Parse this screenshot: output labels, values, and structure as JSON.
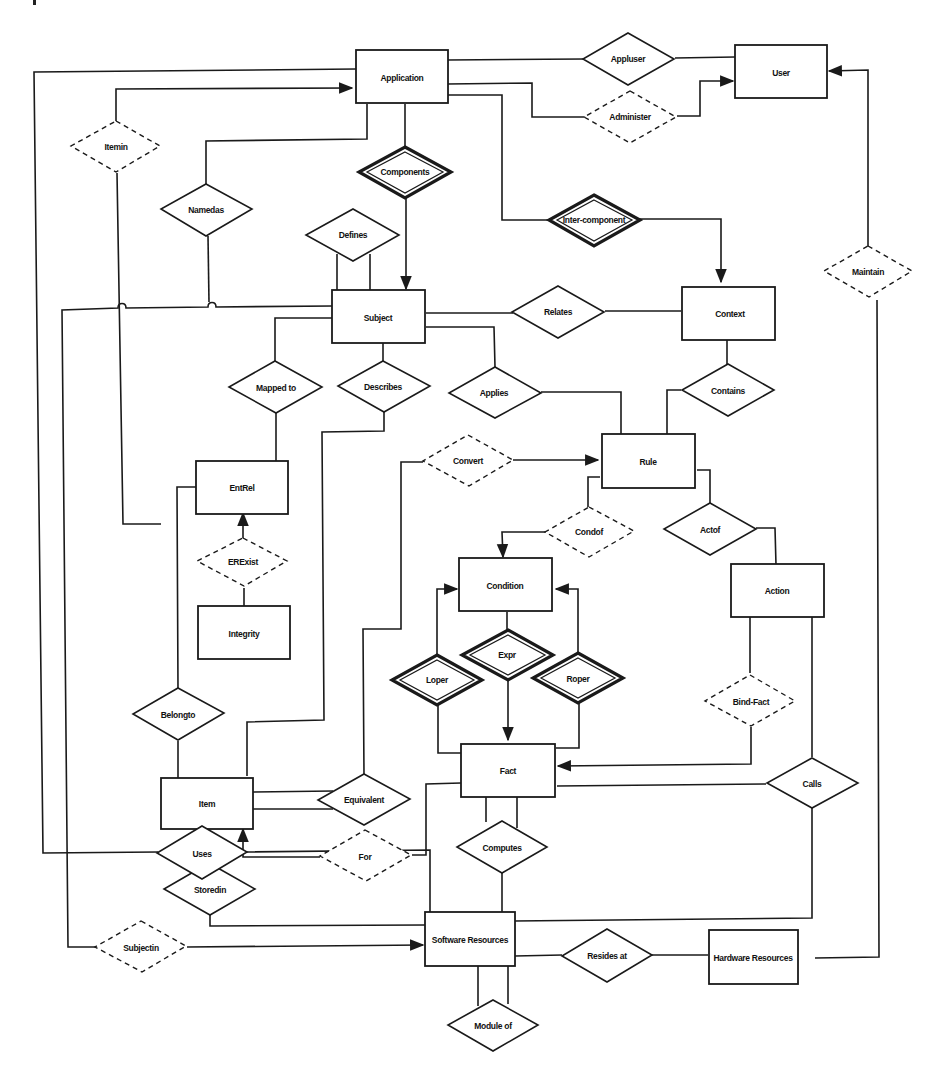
{
  "diagram": {
    "type": "entity-relationship",
    "entities": [
      {
        "id": "application",
        "label": "Application"
      },
      {
        "id": "user",
        "label": "User"
      },
      {
        "id": "subject",
        "label": "Subject"
      },
      {
        "id": "context",
        "label": "Context"
      },
      {
        "id": "entrel",
        "label": "EntRel"
      },
      {
        "id": "rule",
        "label": "Rule"
      },
      {
        "id": "integrity",
        "label": "Integrity"
      },
      {
        "id": "condition",
        "label": "Condition"
      },
      {
        "id": "action",
        "label": "Action"
      },
      {
        "id": "fact",
        "label": "Fact"
      },
      {
        "id": "item",
        "label": "Item"
      },
      {
        "id": "software_resources",
        "label": "Software Resources"
      },
      {
        "id": "hardware_resources",
        "label": "Hardware Resources"
      }
    ],
    "relationships": [
      {
        "id": "appluser",
        "label": "Appluser",
        "style": "solid"
      },
      {
        "id": "administer",
        "label": "Administer",
        "style": "dashed"
      },
      {
        "id": "itemin",
        "label": "Itemin",
        "style": "dashed"
      },
      {
        "id": "components",
        "label": "Components",
        "style": "identifying"
      },
      {
        "id": "namedas",
        "label": "Namedas",
        "style": "solid"
      },
      {
        "id": "defines",
        "label": "Defines",
        "style": "solid"
      },
      {
        "id": "inter_component",
        "label": "Inter-component",
        "style": "identifying"
      },
      {
        "id": "maintain",
        "label": "Maintain",
        "style": "dashed"
      },
      {
        "id": "relates",
        "label": "Relates",
        "style": "solid"
      },
      {
        "id": "mapped_to",
        "label": "Mapped to",
        "style": "solid"
      },
      {
        "id": "describes",
        "label": "Describes",
        "style": "solid"
      },
      {
        "id": "applies",
        "label": "Applies",
        "style": "solid"
      },
      {
        "id": "contains",
        "label": "Contains",
        "style": "solid"
      },
      {
        "id": "convert",
        "label": "Convert",
        "style": "dashed"
      },
      {
        "id": "condof",
        "label": "Condof",
        "style": "dashed"
      },
      {
        "id": "actof",
        "label": "Actof",
        "style": "solid"
      },
      {
        "id": "erexist",
        "label": "ERExist",
        "style": "dashed"
      },
      {
        "id": "expr",
        "label": "Expr",
        "style": "identifying"
      },
      {
        "id": "loper",
        "label": "Loper",
        "style": "identifying"
      },
      {
        "id": "roper",
        "label": "Roper",
        "style": "identifying"
      },
      {
        "id": "bind_fact",
        "label": "Bind-Fact",
        "style": "dashed"
      },
      {
        "id": "belongto",
        "label": "Belongto",
        "style": "solid"
      },
      {
        "id": "equivalent",
        "label": "Equivalent",
        "style": "solid"
      },
      {
        "id": "calls",
        "label": "Calls",
        "style": "solid"
      },
      {
        "id": "for",
        "label": "For",
        "style": "dashed"
      },
      {
        "id": "computes",
        "label": "Computes",
        "style": "solid"
      },
      {
        "id": "storedin",
        "label": "Storedin",
        "style": "solid"
      },
      {
        "id": "subjectin",
        "label": "Subjectin",
        "style": "dashed"
      },
      {
        "id": "resides_at",
        "label": "Resides at",
        "style": "solid"
      },
      {
        "id": "uses",
        "label": "Uses",
        "style": "solid"
      },
      {
        "id": "module_of",
        "label": "Module of",
        "style": "solid"
      }
    ],
    "colors": {
      "stroke": "#1a1a1a",
      "fill": "#ffffff",
      "text": "#111111"
    }
  }
}
